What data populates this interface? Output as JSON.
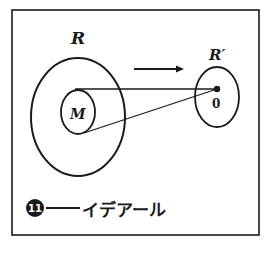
{
  "diagram": {
    "labels": {
      "outer_region": "R",
      "inner_region": "M",
      "image_region": "R′",
      "image_point": "0"
    },
    "caption": {
      "number": "11",
      "dash": "——",
      "text": "イデアール"
    },
    "colors": {
      "ink": "#1a1a1a",
      "background": "#ffffff"
    }
  }
}
